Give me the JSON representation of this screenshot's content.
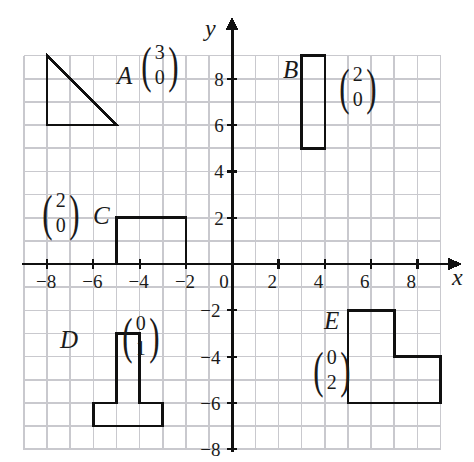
{
  "figure": {
    "kind": "coordinate-grid-with-shapes",
    "background": "#ffffff",
    "grid_color": "#c9c9ce",
    "axis_color": "#101010",
    "shape_stroke": "#101010"
  },
  "axes": {
    "x_label": "x",
    "y_label": "y",
    "x_range": [
      -9,
      9
    ],
    "y_range": [
      -8,
      9
    ],
    "x_ticks": [
      "−8",
      "−6",
      "−4",
      "−2",
      "0",
      "2",
      "4",
      "6",
      "8"
    ],
    "x_tick_values": [
      -8,
      -6,
      -4,
      -2,
      0,
      2,
      4,
      6,
      8
    ],
    "y_ticks": [
      "8",
      "6",
      "4",
      "2",
      "0",
      "−2",
      "−4",
      "−6",
      "−8"
    ],
    "y_tick_values": [
      8,
      6,
      4,
      2,
      0,
      -2,
      -4,
      -6,
      -8
    ],
    "origin_label": "0",
    "grid_spacing_units": 1
  },
  "shapes": [
    {
      "id": "A",
      "name": "triangle",
      "label": "A",
      "vector": {
        "top": "3",
        "bottom": "0"
      },
      "points": [
        [
          -8,
          9
        ],
        [
          -8,
          6
        ],
        [
          -5,
          6
        ]
      ]
    },
    {
      "id": "B",
      "name": "rectangle",
      "label": "B",
      "vector": {
        "top": "2",
        "bottom": "0"
      },
      "points": [
        [
          3,
          9
        ],
        [
          4,
          9
        ],
        [
          4,
          5
        ],
        [
          3,
          5
        ]
      ]
    },
    {
      "id": "C",
      "name": "rectangle",
      "label": "C",
      "vector": {
        "top": "2",
        "bottom": "0"
      },
      "points": [
        [
          -5,
          2
        ],
        [
          -2,
          2
        ],
        [
          -2,
          0
        ],
        [
          -5,
          0
        ]
      ]
    },
    {
      "id": "D",
      "name": "tee-shape",
      "label": "D",
      "vector": {
        "top": "0",
        "bottom": "1"
      },
      "points": [
        [
          -5,
          -3
        ],
        [
          -4,
          -3
        ],
        [
          -4,
          -6
        ],
        [
          -3,
          -6
        ],
        [
          -3,
          -7
        ],
        [
          -6,
          -7
        ],
        [
          -6,
          -6
        ],
        [
          -5,
          -6
        ]
      ]
    },
    {
      "id": "E",
      "name": "ell-shape",
      "label": "E",
      "vector": {
        "top": "0",
        "bottom": "2"
      },
      "points": [
        [
          5,
          -2
        ],
        [
          7,
          -2
        ],
        [
          7,
          -4
        ],
        [
          9,
          -4
        ],
        [
          9,
          -6
        ],
        [
          5,
          -6
        ]
      ]
    }
  ],
  "shape_labels": [
    {
      "id": "A",
      "text": "A",
      "x": 117,
      "y": 63
    },
    {
      "id": "B",
      "text": "B",
      "x": 283,
      "y": 57
    },
    {
      "id": "C",
      "text": "C",
      "x": 93,
      "y": 203
    },
    {
      "id": "D",
      "text": "D",
      "x": 60,
      "y": 327
    },
    {
      "id": "E",
      "text": "E",
      "x": 324,
      "y": 308
    }
  ],
  "vector_labels": [
    {
      "id": "A",
      "top": "3",
      "bottom": "0",
      "x": 138,
      "y": 40
    },
    {
      "id": "B",
      "top": "2",
      "bottom": "0",
      "x": 336,
      "y": 62
    },
    {
      "id": "C",
      "top": "2",
      "bottom": "0",
      "x": 39,
      "y": 188
    },
    {
      "id": "D",
      "top": "0",
      "bottom": "1",
      "x": 119,
      "y": 311
    },
    {
      "id": "E",
      "top": "0",
      "bottom": "2",
      "x": 310,
      "y": 345
    }
  ]
}
